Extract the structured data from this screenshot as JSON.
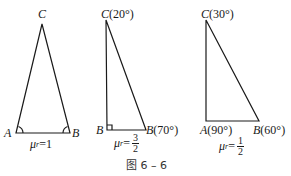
{
  "figure": {
    "caption": "图 6 – 6",
    "triangles": [
      {
        "id": "isosceles",
        "vertices": {
          "A": {
            "label": "A",
            "angle": ""
          },
          "B": {
            "label": "B",
            "angle": ""
          },
          "C": {
            "label": "C",
            "angle": ""
          }
        },
        "mu_label": "μ",
        "mu_sub": "r",
        "mu_eq": "=1"
      },
      {
        "id": "right-20-70",
        "vertices": {
          "A": {
            "label": "B",
            "angle": ""
          },
          "B": {
            "label": "B",
            "angle": "(70°)"
          },
          "C": {
            "label": "C",
            "angle": "(20°)"
          }
        },
        "mu_label": "μ",
        "mu_sub": "r",
        "mu_eq": "=",
        "mu_num": "3",
        "mu_den": "2"
      },
      {
        "id": "right-30-60",
        "vertices": {
          "A": {
            "label": "A",
            "angle": "(90°)"
          },
          "B": {
            "label": "B",
            "angle": "(60°)"
          },
          "C": {
            "label": "C",
            "angle": "(30°)"
          }
        },
        "mu_label": "μ",
        "mu_sub": "r",
        "mu_eq": "=",
        "mu_num": "1",
        "mu_den": "2"
      }
    ]
  }
}
